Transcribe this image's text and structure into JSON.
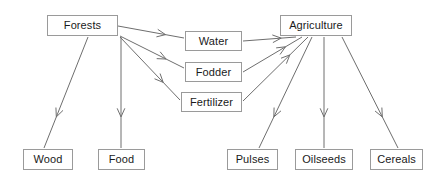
{
  "diagram": {
    "type": "flowchart",
    "canvas": {
      "width": 446,
      "height": 181
    },
    "style": {
      "background_color": "#ffffff",
      "node_fill": "#ffffff",
      "node_border_color": "#9a9a9a",
      "edge_color": "#6e6e6e",
      "text_color": "#1a1a1a",
      "arrowhead": "open-v"
    },
    "nodes": [
      {
        "id": "forests",
        "label": "Forests",
        "x": 47,
        "y": 15,
        "w": 71,
        "h": 21
      },
      {
        "id": "water",
        "label": "Water",
        "x": 185,
        "y": 31,
        "w": 57,
        "h": 20
      },
      {
        "id": "fodder",
        "label": "Fodder",
        "x": 185,
        "y": 62,
        "w": 57,
        "h": 20
      },
      {
        "id": "fertilizer",
        "label": "Fertilizer",
        "x": 181,
        "y": 92,
        "w": 61,
        "h": 20
      },
      {
        "id": "agriculture",
        "label": "Agriculture",
        "x": 280,
        "y": 15,
        "w": 72,
        "h": 21
      },
      {
        "id": "wood",
        "label": "Wood",
        "x": 23,
        "y": 149,
        "w": 50,
        "h": 21
      },
      {
        "id": "food",
        "label": "Food",
        "x": 98,
        "y": 149,
        "w": 47,
        "h": 21
      },
      {
        "id": "pulses",
        "label": "Pulses",
        "x": 227,
        "y": 149,
        "w": 51,
        "h": 21
      },
      {
        "id": "oilseeds",
        "label": "Oilseeds",
        "x": 295,
        "y": 149,
        "w": 58,
        "h": 21
      },
      {
        "id": "cereals",
        "label": "Cereals",
        "x": 370,
        "y": 149,
        "w": 53,
        "h": 21
      }
    ],
    "edges": [
      {
        "id": "forests-water",
        "from": "forests",
        "to": "water",
        "x1": 118,
        "y1": 26,
        "x2": 184,
        "y2": 38
      },
      {
        "id": "forests-fodder",
        "from": "forests",
        "to": "fodder",
        "x1": 120,
        "y1": 36,
        "x2": 184,
        "y2": 68
      },
      {
        "id": "forests-fertilizer",
        "from": "forests",
        "to": "fertilizer",
        "x1": 120,
        "y1": 37,
        "x2": 180,
        "y2": 100
      },
      {
        "id": "forests-wood",
        "from": "forests",
        "to": "wood",
        "x1": 88,
        "y1": 37,
        "x2": 44,
        "y2": 148
      },
      {
        "id": "forests-food",
        "from": "forests",
        "to": "food",
        "x1": 121,
        "y1": 37,
        "x2": 121,
        "y2": 148
      },
      {
        "id": "water-agriculture",
        "from": "water",
        "to": "agriculture",
        "x1": 243,
        "y1": 41,
        "x2": 296,
        "y2": 37
      },
      {
        "id": "fodder-agriculture",
        "from": "fodder",
        "to": "agriculture",
        "x1": 243,
        "y1": 72,
        "x2": 302,
        "y2": 37
      },
      {
        "id": "fertilizer-agriculture",
        "from": "fertilizer",
        "to": "agriculture",
        "x1": 243,
        "y1": 101,
        "x2": 308,
        "y2": 37
      },
      {
        "id": "agriculture-pulses",
        "from": "agriculture",
        "to": "pulses",
        "x1": 312,
        "y1": 37,
        "x2": 259,
        "y2": 148
      },
      {
        "id": "agriculture-oilseeds",
        "from": "agriculture",
        "to": "oilseeds",
        "x1": 324,
        "y1": 37,
        "x2": 324,
        "y2": 148
      },
      {
        "id": "agriculture-cereals",
        "from": "agriculture",
        "to": "cereals",
        "x1": 342,
        "y1": 37,
        "x2": 398,
        "y2": 148
      }
    ]
  }
}
